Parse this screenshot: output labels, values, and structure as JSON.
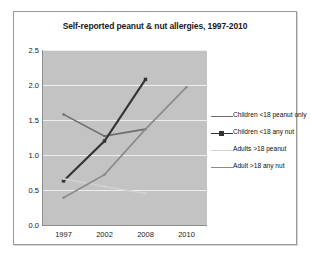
{
  "card": {
    "title": "Self-reported peanut & nut allergies, 1997-2010"
  },
  "chart_data": {
    "type": "line",
    "title": "Self-reported peanut & nut allergies, 1997-2010",
    "xlabel": "",
    "ylabel": "",
    "categories": [
      "1997",
      "2002",
      "2008",
      "2010"
    ],
    "ylim": [
      0.0,
      2.5
    ],
    "yticks": [
      "0.0",
      "0.5",
      "1.0",
      "1.5",
      "2.0",
      "2.5"
    ],
    "ytick_values": [
      0.0,
      0.5,
      1.0,
      1.5,
      2.0,
      2.5
    ],
    "grid": true,
    "legend_position": "right",
    "plot_background": "#c3c3c3",
    "gridline_color": "#efefef",
    "series": [
      {
        "name": "Children <18 peanut only",
        "color": "#6e6e6e",
        "marker": "line",
        "x": [
          "1997",
          "2002",
          "2008"
        ],
        "values": [
          1.58,
          1.27,
          1.37
        ]
      },
      {
        "name": "Children <18 any nut",
        "color": "#333333",
        "marker": "square",
        "x": [
          "1997",
          "2002",
          "2008"
        ],
        "values": [
          0.63,
          1.2,
          2.08
        ]
      },
      {
        "name": "Adults >18 peanut",
        "color": "#d2d2d2",
        "marker": "line",
        "x": [
          "1997",
          "2002",
          "2008"
        ],
        "values": [
          0.66,
          0.55,
          0.45
        ]
      },
      {
        "name": "Adult >18 any nut",
        "color": "#8a8a8a",
        "marker": "line",
        "x": [
          "1997",
          "2002",
          "2008",
          "2010"
        ],
        "values": [
          0.39,
          0.72,
          1.37,
          1.97
        ]
      }
    ]
  },
  "legend": {
    "items": [
      {
        "label": "Children <18 peanut only"
      },
      {
        "label": "Children <18 any nut"
      },
      {
        "label": "Adults >18 peanut"
      },
      {
        "label": "Adult >18 any nut"
      }
    ]
  }
}
